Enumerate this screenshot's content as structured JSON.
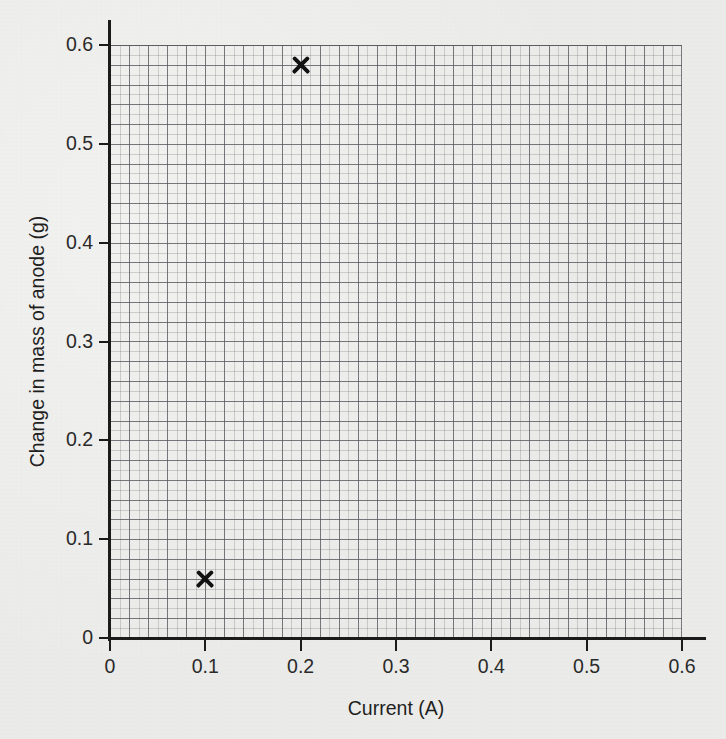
{
  "chart_data": {
    "type": "scatter",
    "title": "",
    "xlabel": "Current (A)",
    "ylabel": "Change in mass of anode (g)",
    "xlim": [
      0,
      0.6
    ],
    "ylim": [
      0,
      0.6
    ],
    "grid": true,
    "grid_minor_step": 0.01,
    "grid_major_step": 0.02,
    "legend": "none",
    "marker_style": "x",
    "marker_color": "#111111",
    "x_ticks": [
      "0",
      "0.1",
      "0.2",
      "0.3",
      "0.4",
      "0.5",
      "0.6"
    ],
    "x_tick_values": [
      0,
      0.1,
      0.2,
      0.3,
      0.4,
      0.5,
      0.6
    ],
    "y_ticks": [
      "0",
      "0.1",
      "0.2",
      "0.3",
      "0.4",
      "0.5",
      "0.6"
    ],
    "y_tick_values": [
      0,
      0.1,
      0.2,
      0.3,
      0.4,
      0.5,
      0.6
    ],
    "series": [
      {
        "name": "Measured points",
        "points": [
          {
            "x": 0.1,
            "y": 0.06
          },
          {
            "x": 0.2,
            "y": 0.58
          }
        ]
      }
    ]
  },
  "style": {
    "background_color": "#ebebe9",
    "axis_color": "#1b1b1b",
    "grid_color": "#55555c",
    "text_color": "#1f1f1f"
  }
}
